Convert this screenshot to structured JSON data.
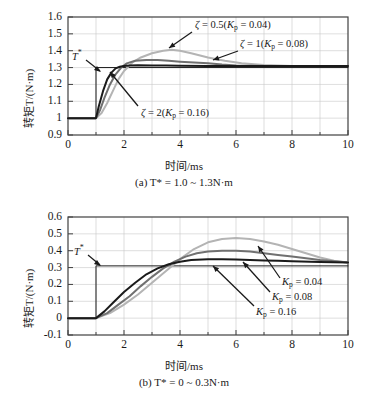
{
  "figure": {
    "panels": [
      {
        "id": "a",
        "caption": "(a) T* = 1.0 ~ 1.3N·m",
        "xlabel": "时间/ms",
        "ylabel": "转矩T/(N·m)",
        "reference_label": "T*",
        "xticks": [
          "0",
          "2",
          "4",
          "6",
          "8",
          "10"
        ],
        "yticks": [
          "1.6",
          "1.5",
          "1.4",
          "1.3",
          "1.2",
          "1.1",
          "1",
          "0.9"
        ],
        "annotations": [
          {
            "text": "ζ = 0.5(Kp = 0.04)",
            "series": "zeta-0.5"
          },
          {
            "text": "ζ = 1(Kp = 0.08)",
            "series": "zeta-1"
          },
          {
            "text": "ζ = 2(Kp = 0.16)",
            "series": "zeta-2"
          }
        ]
      },
      {
        "id": "b",
        "caption": "(b) T* = 0 ~ 0.3N·m",
        "xlabel": "时间/ms",
        "ylabel": "转矩T/(N·m)",
        "reference_label": "T*",
        "xticks": [
          "0",
          "2",
          "4",
          "6",
          "8",
          "10"
        ],
        "yticks": [
          "0.6",
          "0.5",
          "0.4",
          "0.3",
          "0.2",
          "0.1",
          "0",
          "-0.1"
        ],
        "annotations": [
          {
            "text": "Kp = 0.04",
            "series": "kp-0.04"
          },
          {
            "text": "Kp = 0.08",
            "series": "kp-0.08"
          },
          {
            "text": "Kp = 0.16",
            "series": "kp-0.16"
          }
        ]
      }
    ]
  },
  "chart_data": [
    {
      "type": "line",
      "id": "panel-a",
      "title": "(a) T* = 1.0 ~ 1.3N·m",
      "xlabel": "时间/ms",
      "ylabel": "转矩T/(N·m)",
      "xlim": [
        0,
        10
      ],
      "ylim": [
        0.9,
        1.6
      ],
      "xticks": [
        0,
        2,
        4,
        6,
        8,
        10
      ],
      "yticks": [
        0.9,
        1.0,
        1.1,
        1.2,
        1.3,
        1.4,
        1.5,
        1.6
      ],
      "grid": true,
      "legend": "annotated-arrows",
      "series": [
        {
          "name": "T*",
          "role": "reference-step",
          "color": "#1a1a1a",
          "x": [
            0,
            1.0,
            1.0,
            10
          ],
          "values": [
            1.0,
            1.0,
            1.3,
            1.3
          ]
        },
        {
          "name": "ζ = 0.5 (Kp = 0.04)",
          "color": "#b4b4b4",
          "x": [
            0,
            1.0,
            1.2,
            1.4,
            1.6,
            1.8,
            2.0,
            2.3,
            2.6,
            3.0,
            3.4,
            3.7,
            4.0,
            4.4,
            5.0,
            5.6,
            6.2,
            7.0,
            8.0,
            9.0,
            10
          ],
          "values": [
            1.0,
            1.0,
            1.03,
            1.09,
            1.16,
            1.23,
            1.28,
            1.33,
            1.36,
            1.385,
            1.4,
            1.405,
            1.4,
            1.385,
            1.36,
            1.34,
            1.325,
            1.315,
            1.31,
            1.31,
            1.31
          ]
        },
        {
          "name": "ζ = 1 (Kp = 0.08)",
          "color": "#707070",
          "x": [
            0,
            1.0,
            1.15,
            1.3,
            1.5,
            1.7,
            1.9,
            2.1,
            2.4,
            2.8,
            3.2,
            3.6,
            4.0,
            4.5,
            5.0,
            5.5,
            6.0,
            7.0,
            8.0,
            9.0,
            10
          ],
          "values": [
            1.0,
            1.0,
            1.05,
            1.12,
            1.2,
            1.26,
            1.3,
            1.325,
            1.34,
            1.345,
            1.345,
            1.34,
            1.335,
            1.33,
            1.325,
            1.318,
            1.313,
            1.31,
            1.31,
            1.31,
            1.31
          ]
        },
        {
          "name": "ζ = 2 (Kp = 0.16)",
          "color": "#1a1a1a",
          "x": [
            0,
            1.0,
            1.1,
            1.25,
            1.4,
            1.55,
            1.7,
            1.85,
            2.0,
            2.2,
            2.5,
            3.0,
            3.5,
            4.0,
            5.0,
            6.0,
            7.0,
            8.0,
            9.0,
            10
          ],
          "values": [
            1.0,
            1.0,
            1.07,
            1.16,
            1.23,
            1.27,
            1.295,
            1.305,
            1.31,
            1.313,
            1.314,
            1.313,
            1.312,
            1.311,
            1.31,
            1.31,
            1.31,
            1.31,
            1.31,
            1.31
          ]
        }
      ]
    },
    {
      "type": "line",
      "id": "panel-b",
      "title": "(b) T* = 0 ~ 0.3N·m",
      "xlabel": "时间/ms",
      "ylabel": "转矩T/(N·m)",
      "xlim": [
        0,
        10
      ],
      "ylim": [
        -0.1,
        0.6
      ],
      "xticks": [
        0,
        2,
        4,
        6,
        8,
        10
      ],
      "yticks": [
        -0.1,
        0,
        0.1,
        0.2,
        0.3,
        0.4,
        0.5,
        0.6
      ],
      "grid": true,
      "legend": "annotated-arrows",
      "series": [
        {
          "name": "T*",
          "role": "reference-step",
          "color": "#1a1a1a",
          "x": [
            0,
            1.0,
            1.0,
            10
          ],
          "values": [
            0.0,
            0.0,
            0.31,
            0.31
          ]
        },
        {
          "name": "Kp = 0.04",
          "color": "#b4b4b4",
          "x": [
            0,
            1.0,
            1.5,
            2.0,
            2.5,
            3.0,
            3.5,
            4.0,
            4.5,
            5.0,
            5.5,
            6.0,
            6.5,
            7.0,
            7.5,
            8.0,
            8.5,
            9.0,
            9.5,
            10
          ],
          "values": [
            0.0,
            0.0,
            0.03,
            0.08,
            0.14,
            0.21,
            0.28,
            0.35,
            0.41,
            0.45,
            0.47,
            0.475,
            0.47,
            0.455,
            0.435,
            0.41,
            0.385,
            0.36,
            0.34,
            0.33
          ]
        },
        {
          "name": "Kp = 0.08",
          "color": "#707070",
          "x": [
            0,
            1.0,
            1.4,
            1.8,
            2.2,
            2.6,
            3.0,
            3.4,
            3.8,
            4.2,
            4.6,
            5.0,
            5.5,
            6.0,
            6.5,
            7.0,
            7.5,
            8.0,
            8.5,
            9.0,
            9.5,
            10
          ],
          "values": [
            0.0,
            0.0,
            0.03,
            0.08,
            0.13,
            0.19,
            0.245,
            0.295,
            0.335,
            0.365,
            0.385,
            0.395,
            0.4,
            0.4,
            0.395,
            0.385,
            0.375,
            0.365,
            0.355,
            0.345,
            0.337,
            0.33
          ]
        },
        {
          "name": "Kp = 0.16",
          "color": "#1a1a1a",
          "x": [
            0,
            1.0,
            1.3,
            1.6,
            2.0,
            2.4,
            2.8,
            3.2,
            3.6,
            4.0,
            4.4,
            5.0,
            5.5,
            6.0,
            6.5,
            7.0,
            7.5,
            8.0,
            9.0,
            10
          ],
          "values": [
            0.0,
            0.0,
            0.04,
            0.09,
            0.155,
            0.21,
            0.26,
            0.295,
            0.32,
            0.335,
            0.345,
            0.35,
            0.35,
            0.348,
            0.345,
            0.342,
            0.34,
            0.337,
            0.333,
            0.33
          ]
        }
      ]
    }
  ]
}
